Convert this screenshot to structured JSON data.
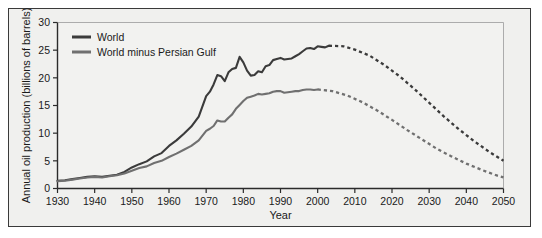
{
  "chart_data": {
    "type": "line",
    "title": "",
    "xlabel": "Year",
    "ylabel": "Annual oil production (billions of barrels)",
    "xlim": [
      1930,
      2050
    ],
    "ylim": [
      0,
      30
    ],
    "xticks": [
      1930,
      1940,
      1950,
      1960,
      1970,
      1980,
      1990,
      2000,
      2010,
      2020,
      2030,
      2040,
      2050
    ],
    "yticks": [
      0,
      5,
      10,
      15,
      20,
      25,
      30
    ],
    "grid": false,
    "legend_position": "top-left",
    "colors": {
      "world": "#3b3b3b",
      "world_minus_gulf": "#707070"
    },
    "series": [
      {
        "name": "World",
        "color": "#3b3b3b",
        "historical_end_year": 2003,
        "x": [
          1930,
          1932,
          1934,
          1936,
          1938,
          1940,
          1942,
          1944,
          1946,
          1948,
          1950,
          1952,
          1954,
          1956,
          1958,
          1960,
          1962,
          1964,
          1966,
          1968,
          1970,
          1971,
          1972,
          1973,
          1974,
          1975,
          1976,
          1977,
          1978,
          1979,
          1980,
          1981,
          1982,
          1983,
          1984,
          1985,
          1986,
          1987,
          1988,
          1989,
          1990,
          1991,
          1992,
          1993,
          1994,
          1995,
          1996,
          1997,
          1998,
          1999,
          2000,
          2001,
          2002,
          2003
        ],
        "y": [
          1.4,
          1.5,
          1.7,
          1.9,
          2.1,
          2.2,
          2.1,
          2.3,
          2.5,
          3.0,
          3.8,
          4.4,
          4.9,
          5.8,
          6.4,
          7.7,
          8.7,
          9.9,
          11.2,
          13.0,
          16.7,
          17.5,
          18.8,
          20.5,
          20.3,
          19.4,
          21.0,
          21.6,
          21.8,
          23.8,
          22.8,
          21.3,
          20.4,
          20.5,
          21.2,
          21.0,
          22.1,
          22.3,
          23.2,
          23.4,
          23.6,
          23.3,
          23.4,
          23.5,
          23.9,
          24.3,
          24.8,
          25.3,
          25.4,
          25.2,
          25.7,
          25.6,
          25.5,
          25.8
        ],
        "projection_x": [
          2003,
          2007,
          2010,
          2014,
          2018,
          2022,
          2026,
          2030,
          2034,
          2038,
          2042,
          2046,
          2050
        ],
        "projection_y": [
          25.8,
          25.7,
          25.1,
          24.0,
          22.3,
          20.3,
          18.0,
          15.5,
          13.0,
          10.7,
          8.6,
          6.7,
          5.0
        ]
      },
      {
        "name": "World minus Persian Gulf",
        "color": "#707070",
        "historical_end_year": 2000,
        "x": [
          1930,
          1932,
          1934,
          1936,
          1938,
          1940,
          1942,
          1944,
          1946,
          1948,
          1950,
          1952,
          1954,
          1956,
          1958,
          1960,
          1962,
          1964,
          1966,
          1968,
          1970,
          1971,
          1972,
          1973,
          1974,
          1975,
          1976,
          1977,
          1978,
          1979,
          1980,
          1981,
          1982,
          1983,
          1984,
          1985,
          1986,
          1987,
          1988,
          1989,
          1990,
          1991,
          1992,
          1993,
          1994,
          1995,
          1996,
          1997,
          1998,
          1999,
          2000
        ],
        "y": [
          1.3,
          1.4,
          1.6,
          1.8,
          2.0,
          2.1,
          2.0,
          2.2,
          2.4,
          2.7,
          3.2,
          3.7,
          4.0,
          4.6,
          5.0,
          5.7,
          6.3,
          7.0,
          7.7,
          8.7,
          10.4,
          10.8,
          11.3,
          12.3,
          12.1,
          12.1,
          12.8,
          13.4,
          14.4,
          15.1,
          15.8,
          16.4,
          16.6,
          16.8,
          17.1,
          17.0,
          17.1,
          17.2,
          17.5,
          17.6,
          17.6,
          17.3,
          17.4,
          17.5,
          17.6,
          17.6,
          17.8,
          17.9,
          17.9,
          17.8,
          17.9
        ],
        "projection_x": [
          2000,
          2004,
          2008,
          2012,
          2016,
          2020,
          2024,
          2028,
          2032,
          2036,
          2040,
          2044,
          2048,
          2050
        ],
        "projection_y": [
          17.9,
          17.6,
          16.8,
          15.6,
          14.1,
          12.4,
          10.6,
          8.9,
          7.2,
          5.8,
          4.5,
          3.4,
          2.4,
          2.0
        ]
      }
    ]
  },
  "legend": {
    "items": [
      {
        "label": "World",
        "color": "#3b3b3b"
      },
      {
        "label": "World minus Persian Gulf",
        "color": "#707070"
      }
    ]
  },
  "axes": {
    "y_label": "Annual oil production (billions of barrels)",
    "x_label": "Year",
    "y_tick_labels": [
      "0",
      "5",
      "10",
      "15",
      "20",
      "25",
      "30"
    ],
    "x_tick_labels": [
      "1930",
      "1940",
      "1950",
      "1960",
      "1970",
      "1980",
      "1990",
      "2000",
      "2010",
      "2020",
      "2030",
      "2040",
      "2050"
    ]
  }
}
